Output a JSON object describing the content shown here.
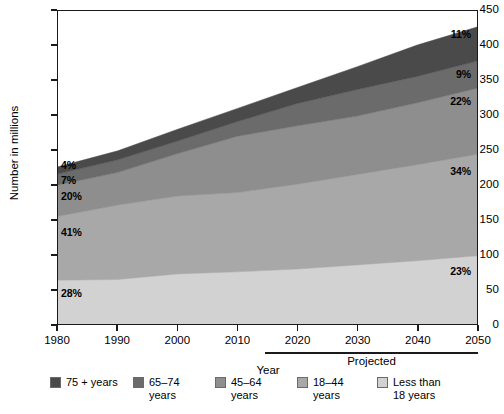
{
  "chart_data": {
    "type": "area",
    "title": "",
    "xlabel": "Year",
    "ylabel": "Number in millions",
    "xlim": [
      1980,
      2050
    ],
    "ylim": [
      0,
      450
    ],
    "grid": false,
    "legend_position": "bottom",
    "stacked": true,
    "x": [
      1980,
      1990,
      2000,
      2010,
      2020,
      2030,
      2040,
      2050
    ],
    "x_ticks": [
      "1980",
      "1990",
      "2000",
      "2010",
      "2020",
      "2030",
      "2040",
      "2050"
    ],
    "y_ticks": [
      "0",
      "50",
      "100",
      "150",
      "200",
      "250",
      "300",
      "350",
      "400",
      "450"
    ],
    "projected_note": "Projected",
    "projected_range": [
      2010,
      2050
    ],
    "series": [
      {
        "name": "Less than 18 years",
        "color": "#d2d2d2",
        "values": [
          63,
          64,
          72,
          75,
          79,
          85,
          91,
          98
        ],
        "start_pct": "28%",
        "end_pct": "23%"
      },
      {
        "name": "18–44 years",
        "color": "#a8a8a8",
        "values": [
          92,
          107,
          112,
          114,
          122,
          130,
          138,
          146
        ],
        "start_pct": "41%",
        "end_pct": "34%"
      },
      {
        "name": "45–64 years",
        "color": "#8e8e8e",
        "values": [
          45,
          47,
          61,
          81,
          84,
          84,
          89,
          95
        ],
        "start_pct": "20%",
        "end_pct": "22%"
      },
      {
        "name": "65–74 years",
        "color": "#6b6b6b",
        "values": [
          16,
          18,
          18,
          21,
          32,
          38,
          38,
          39
        ],
        "start_pct": "7%",
        "end_pct": "9%"
      },
      {
        "name": "75 + years",
        "color": "#4a4a4a",
        "values": [
          10,
          13,
          17,
          19,
          23,
          33,
          45,
          49
        ],
        "start_pct": "4%",
        "end_pct": "11%"
      }
    ],
    "totals": [
      226,
      249,
      280,
      310,
      340,
      370,
      401,
      427
    ]
  },
  "axes": {
    "y_title": "Number in millions",
    "x_title": "Year",
    "projected": "Projected",
    "y_ticks": [
      {
        "value": 450,
        "label": "450"
      },
      {
        "value": 400,
        "label": "400"
      },
      {
        "value": 350,
        "label": "350"
      },
      {
        "value": 300,
        "label": "300"
      },
      {
        "value": 250,
        "label": "250"
      },
      {
        "value": 200,
        "label": "200"
      },
      {
        "value": 150,
        "label": "150"
      },
      {
        "value": 100,
        "label": "100"
      },
      {
        "value": 50,
        "label": "50"
      },
      {
        "value": 0,
        "label": "0"
      }
    ],
    "x_ticks": [
      {
        "value": 1980,
        "label": "1980"
      },
      {
        "value": 1990,
        "label": "1990"
      },
      {
        "value": 2000,
        "label": "2000"
      },
      {
        "value": 2010,
        "label": "2010"
      },
      {
        "value": 2020,
        "label": "2020"
      },
      {
        "value": 2030,
        "label": "2030"
      },
      {
        "value": 2040,
        "label": "2040"
      },
      {
        "value": 2050,
        "label": "2050"
      }
    ]
  },
  "percent_labels_left": [
    {
      "text": "4%",
      "top": 159
    },
    {
      "text": "7%",
      "top": 174
    },
    {
      "text": "20%",
      "top": 190
    },
    {
      "text": "41%",
      "top": 226
    },
    {
      "text": "28%",
      "top": 287
    }
  ],
  "percent_labels_right": [
    {
      "text": "11%",
      "top": 28
    },
    {
      "text": "9%",
      "top": 68
    },
    {
      "text": "22%",
      "top": 95
    },
    {
      "text": "34%",
      "top": 165
    },
    {
      "text": "23%",
      "top": 265
    }
  ],
  "legend": {
    "items": [
      {
        "label": "75 + years",
        "color": "#4a4a4a",
        "left": 50,
        "width": 88
      },
      {
        "label": "65–74\nyears",
        "color": "#6b6b6b",
        "left": 133,
        "width": 80
      },
      {
        "label": "45–64\nyears",
        "color": "#8e8e8e",
        "left": 215,
        "width": 80
      },
      {
        "label": "18–44\nyears",
        "color": "#a8a8a8",
        "left": 297,
        "width": 80
      },
      {
        "label": "Less than\n18 years",
        "color": "#d2d2d2",
        "left": 377,
        "width": 95
      }
    ]
  }
}
